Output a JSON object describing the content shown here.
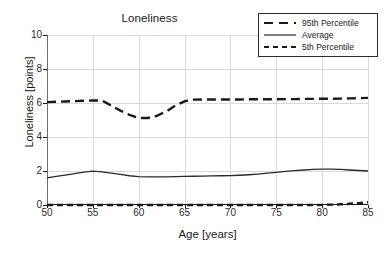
{
  "chart_data": {
    "type": "line",
    "title": "Loneliness",
    "xlabel": "Age [years]",
    "ylabel": "Loneliness [points]",
    "xlim": [
      50,
      85
    ],
    "ylim": [
      0,
      10
    ],
    "xticks": [
      50,
      55,
      60,
      65,
      70,
      75,
      80,
      85
    ],
    "yticks": [
      0,
      2,
      4,
      6,
      8,
      10
    ],
    "grid": true,
    "legend_position": "top-right",
    "x": [
      50,
      51,
      52,
      53,
      54,
      55,
      56,
      57,
      58,
      59,
      60,
      61,
      62,
      63,
      64,
      65,
      66,
      67,
      68,
      69,
      70,
      71,
      72,
      73,
      74,
      75,
      76,
      77,
      78,
      79,
      80,
      81,
      82,
      83,
      84,
      85
    ],
    "series": [
      {
        "name": "95th Percentile",
        "style": "dashed-long",
        "color": "#1a1a1a",
        "values": [
          6.05,
          6.07,
          6.09,
          6.11,
          6.13,
          6.15,
          6.14,
          5.85,
          5.55,
          5.3,
          5.12,
          5.12,
          5.25,
          5.5,
          5.85,
          6.1,
          6.2,
          6.21,
          6.21,
          6.21,
          6.21,
          6.21,
          6.22,
          6.22,
          6.22,
          6.22,
          6.23,
          6.23,
          6.24,
          6.24,
          6.25,
          6.25,
          6.26,
          6.27,
          6.28,
          6.3
        ]
      },
      {
        "name": "Average",
        "style": "solid",
        "color": "#2b2b2b",
        "values": [
          1.6,
          1.68,
          1.76,
          1.84,
          1.93,
          1.99,
          1.95,
          1.88,
          1.8,
          1.72,
          1.67,
          1.66,
          1.66,
          1.66,
          1.67,
          1.68,
          1.69,
          1.7,
          1.71,
          1.72,
          1.73,
          1.75,
          1.78,
          1.82,
          1.87,
          1.92,
          1.98,
          2.02,
          2.06,
          2.09,
          2.11,
          2.11,
          2.09,
          2.06,
          2.03,
          2.0
        ]
      },
      {
        "name": "5th Percentile",
        "style": "dashed-short",
        "color": "#1a1a1a",
        "values": [
          0.0,
          0.0,
          0.0,
          0.0,
          0.0,
          0.0,
          0.0,
          0.0,
          0.0,
          0.0,
          0.0,
          0.0,
          0.0,
          0.0,
          0.0,
          0.0,
          0.0,
          0.0,
          0.0,
          0.0,
          0.0,
          0.0,
          0.0,
          0.0,
          0.0,
          0.0,
          0.0,
          0.0,
          0.0,
          0.0,
          0.01,
          0.02,
          0.04,
          0.07,
          0.11,
          0.16
        ]
      }
    ]
  },
  "legend": {
    "items": [
      {
        "label": "95th Percentile"
      },
      {
        "label": "Average"
      },
      {
        "label": "5th Percentile"
      }
    ]
  }
}
